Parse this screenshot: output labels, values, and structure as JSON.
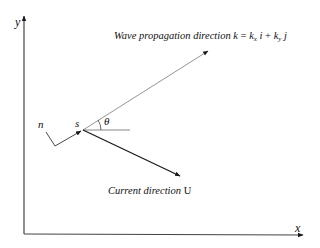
{
  "diagram": {
    "axes": {
      "x_label": "x",
      "y_label": "y"
    },
    "wave": {
      "label_text": "Wave propagation direction",
      "eq_k": "k",
      "eq_equals": " = ",
      "eq_kx": "k",
      "eq_kx_sub": "x",
      "eq_i": " i",
      "eq_plus": " + ",
      "eq_ky": "k",
      "eq_ky_sub": "y",
      "eq_j": " j"
    },
    "current": {
      "label_text": "Current direction",
      "symbol": "U"
    },
    "points": {
      "n_label": "n",
      "s_label": "s"
    },
    "angle": {
      "label": "θ"
    },
    "colors": {
      "line": "#1a1a1a",
      "thin_line": "#555555",
      "background": "#ffffff"
    }
  }
}
